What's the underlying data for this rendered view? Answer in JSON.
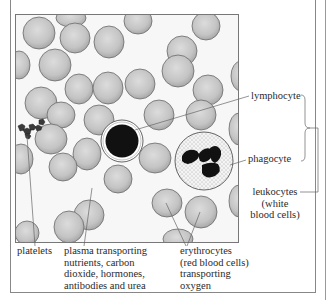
{
  "diagram": {
    "labels": {
      "lymphocyte": "lymphocyte",
      "phagocyte": "phagocyte",
      "leukocytes_line1": "leukocytes",
      "leukocytes_line2": "(white",
      "leukocytes_line3": "blood cells)",
      "platelets": "platelets",
      "plasma_line1": "plasma transporting",
      "plasma_line2": "nutrients, carbon",
      "plasma_line3": "dioxide, hormones,",
      "plasma_line4": "antibodies and urea",
      "erythrocytes_line1": "erythrocytes",
      "erythrocytes_line2": "(red blood cells)",
      "erythrocytes_line3": "transporting",
      "erythrocytes_line4": "oxygen"
    },
    "colors": {
      "red_cell_fill": "#c9c9c9",
      "red_cell_edge": "#6a6a6a",
      "nucleus": "#111111",
      "plasma_background": "#f7f7f7",
      "leader_line": "#666666"
    },
    "components": [
      {
        "name": "erythrocytes",
        "description": "red blood cells",
        "function": "transporting oxygen"
      },
      {
        "name": "leukocytes",
        "description": "white blood cells",
        "types": [
          "lymphocyte",
          "phagocyte"
        ]
      },
      {
        "name": "platelets"
      },
      {
        "name": "plasma",
        "function": "transporting nutrients, carbon dioxide, hormones, antibodies and urea"
      }
    ]
  }
}
